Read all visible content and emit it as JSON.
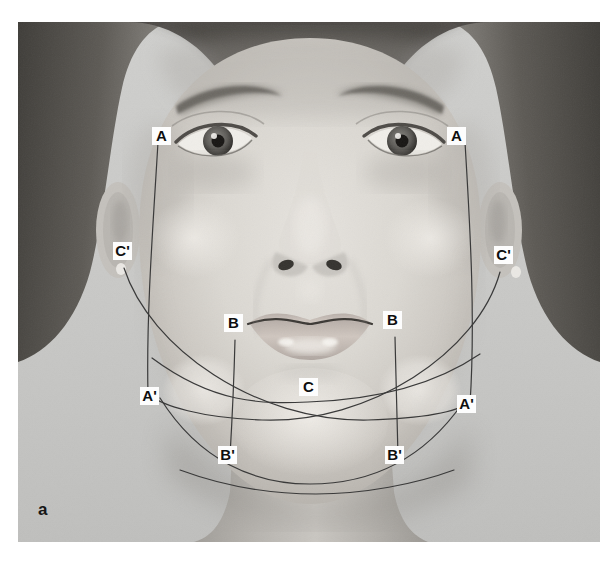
{
  "figure": {
    "panel_letter": "a",
    "caption_partial": "",
    "background_color": "#ffffff",
    "plate_color": "#c9c9c7"
  },
  "photo": {
    "subject": "frontal-female-face-photograph",
    "tone": "grayscale",
    "skin_light": "#dcdad6",
    "skin_mid": "#c3c0bb",
    "skin_shadow": "#a5a29d",
    "hair_dark": "#4a4743",
    "background_gray": "#c9c9c7"
  },
  "markers": [
    {
      "id": "A-left",
      "label": "A",
      "x": 152,
      "y": 127
    },
    {
      "id": "A-right",
      "label": "A",
      "x": 447,
      "y": 127
    },
    {
      "id": "Cp-left",
      "label": "C'",
      "x": 113,
      "y": 242
    },
    {
      "id": "Cp-right",
      "label": "C'",
      "x": 494,
      "y": 246
    },
    {
      "id": "B-left",
      "label": "B",
      "x": 224,
      "y": 314
    },
    {
      "id": "B-right",
      "label": "B",
      "x": 383,
      "y": 311
    },
    {
      "id": "Ap-left",
      "label": "A'",
      "x": 140,
      "y": 387
    },
    {
      "id": "C-mid",
      "label": "C",
      "x": 299,
      "y": 378
    },
    {
      "id": "Ap-right",
      "label": "A'",
      "x": 457,
      "y": 395
    },
    {
      "id": "Bp-left",
      "label": "B'",
      "x": 218,
      "y": 446
    },
    {
      "id": "Bp-right",
      "label": "B'",
      "x": 385,
      "y": 446
    }
  ],
  "marker_styles": {
    "box_background": "#fdfdfd",
    "text_color": "#0e0e0e",
    "line_color": "#3a3a3a"
  },
  "annotation_lines": {
    "description": "facial-landmark-guide-lines",
    "stroke": "#3a3a3a",
    "stroke_width": 1.2,
    "paths": [
      {
        "name": "line-A-to-Ap-left",
        "d": "M 152 148 C 150 215, 146 300, 148 386"
      },
      {
        "name": "line-A-to-Ap-right",
        "d": "M 459 148 C 463 215, 468 300, 464 398"
      },
      {
        "name": "curve-Cp-left-to-Ap-right",
        "d": "M 122 262 C 150 340, 260 412, 368 412 C 430 412, 458 404, 466 396"
      },
      {
        "name": "curve-Cp-right-to-Ap-left",
        "d": "M 500 266 C 478 342, 370 414, 262 412 C 198 410, 160 398, 148 388"
      },
      {
        "name": "line-B-to-Bp-left",
        "d": "M 233 334 C 232 372, 230 414, 228 448"
      },
      {
        "name": "line-B-to-Bp-right",
        "d": "M 392 331 C 393 372, 394 414, 395 448"
      },
      {
        "name": "curve-C-submental",
        "d": "M 152 352 C 210 390, 250 395, 300 394 C 360 393, 420 382, 470 348"
      },
      {
        "name": "curve-Bp-jawline",
        "d": "M 160 392 C 200 452, 250 474, 308 474 C 372 474, 420 450, 458 398"
      },
      {
        "name": "curve-neck-lower",
        "d": "M 178 462 C 230 478, 280 482, 312 482 C 360 482, 410 474, 448 462"
      }
    ]
  }
}
